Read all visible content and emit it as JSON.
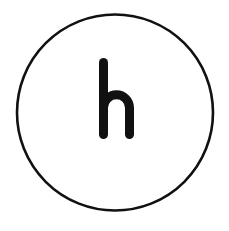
{
  "canvas": {
    "width": 229,
    "height": 231,
    "background_color": "#ffffff"
  },
  "icon": {
    "name": "letter-h-in-circle-icon",
    "description": "Bold lowercase letter h centered inside a thin circular outline",
    "glyph": "h",
    "glyph_case": "lowercase",
    "glyph_color": "#111111",
    "glyph_style": "geometric rounded sans-serif, heavy weight, rounded stroke terminals",
    "glyph_bounds": {
      "x": 99,
      "y": 58,
      "width": 35,
      "height": 81
    },
    "glyph_stroke_width": 9,
    "circle": {
      "name": "circle-outline",
      "center_x": 115,
      "center_y": 112.5,
      "radius": 98,
      "stroke_color": "#111111",
      "stroke_width": 2.6,
      "fill": "none"
    }
  }
}
